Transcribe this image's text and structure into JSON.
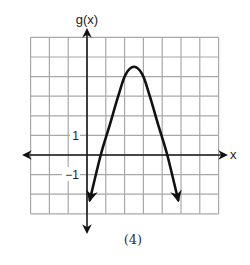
{
  "chart_data": {
    "type": "line",
    "title": "",
    "xlabel": "x",
    "ylabel": "g(x)",
    "caption": "(4)",
    "grid": true,
    "xlim": [
      -3,
      7
    ],
    "ylim": [
      -3,
      6
    ],
    "tick_labels": [
      {
        "axis": "y",
        "value": 1,
        "label": "1"
      },
      {
        "axis": "y",
        "value": -1,
        "label": "−1"
      }
    ],
    "series": [
      {
        "name": "g(x)",
        "description": "downward-opening parabola with arrows at both ends",
        "vertex": [
          2.5,
          4.5
        ],
        "x_intercepts": [
          0.73,
          4.27
        ],
        "points": [
          [
            0.15,
            -2.3
          ],
          [
            0.73,
            0
          ],
          [
            1.2,
            1.5
          ],
          [
            1.66,
            3.0
          ],
          [
            2.05,
            4.1
          ],
          [
            2.5,
            4.5
          ],
          [
            2.95,
            4.1
          ],
          [
            3.34,
            3.0
          ],
          [
            3.8,
            1.5
          ],
          [
            4.27,
            0
          ],
          [
            4.85,
            -2.3
          ]
        ]
      }
    ]
  },
  "labels": {
    "y_axis": "g(x)",
    "x_axis": "x",
    "tick_pos_1": "1",
    "tick_neg_1": "−1",
    "caption": "(4)"
  }
}
